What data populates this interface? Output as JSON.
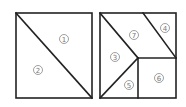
{
  "diagram": {
    "type": "tangram-square-dissection",
    "left_square": {
      "pieces": [
        {
          "id": "1",
          "label": "①",
          "shape": "triangle",
          "x": 64,
          "y": 39
        },
        {
          "id": "2",
          "label": "②",
          "shape": "triangle",
          "x": 38,
          "y": 70
        }
      ]
    },
    "right_square": {
      "pieces": [
        {
          "id": "7",
          "label": "⑦",
          "shape": "parallelogram",
          "x": 134,
          "y": 35
        },
        {
          "id": "4",
          "label": "④",
          "shape": "triangle",
          "x": 165,
          "y": 28
        },
        {
          "id": "3",
          "label": "③",
          "shape": "triangle",
          "x": 115,
          "y": 57
        },
        {
          "id": "5",
          "label": "⑤",
          "shape": "triangle",
          "x": 129,
          "y": 85
        },
        {
          "id": "6",
          "label": "⑥",
          "shape": "square",
          "x": 159,
          "y": 78
        }
      ]
    }
  }
}
